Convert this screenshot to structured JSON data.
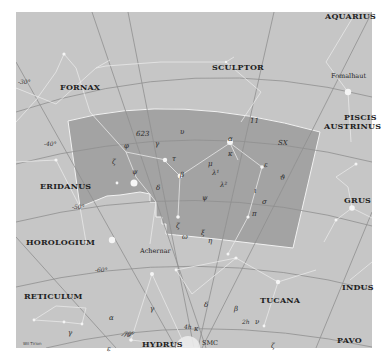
{
  "map": {
    "highlighted_constellation": "Phoenix",
    "colors": {
      "background": "#c6c6c6",
      "highlight": "#a3a3a3",
      "grid": "#8f8f8f",
      "lines": "#e8e8e8",
      "boundary": "#f2f2f2"
    },
    "constellations": [
      {
        "name": "AQUARIUS",
        "x": 325,
        "y": 12
      },
      {
        "name": "FORNAX",
        "x": 60,
        "y": 83
      },
      {
        "name": "SCULPTOR",
        "x": 212,
        "y": 63
      },
      {
        "name": "PISCIS",
        "x": 344,
        "y": 113
      },
      {
        "name": "AUSTRINUS",
        "x": 324,
        "y": 122
      },
      {
        "name": "ERIDANUS",
        "x": 40,
        "y": 182
      },
      {
        "name": "GRUS",
        "x": 344,
        "y": 196
      },
      {
        "name": "HOROLOGIUM",
        "x": 26,
        "y": 238
      },
      {
        "name": "INDUS",
        "x": 342,
        "y": 283
      },
      {
        "name": "RETICULUM",
        "x": 24,
        "y": 292
      },
      {
        "name": "TUCANA",
        "x": 260,
        "y": 296
      },
      {
        "name": "PAVO",
        "x": 337,
        "y": 336
      },
      {
        "name": "HYDRUS",
        "x": 142,
        "y": 340
      }
    ],
    "star_names": [
      {
        "name": "Fomalhaut",
        "x": 331,
        "y": 72
      },
      {
        "name": "Achernar",
        "x": 140,
        "y": 247
      }
    ],
    "greek_letters": [
      {
        "t": "623",
        "x": 136,
        "y": 130
      },
      {
        "t": "υ",
        "x": 180,
        "y": 128
      },
      {
        "t": "φ",
        "x": 124,
        "y": 142
      },
      {
        "t": "γ",
        "x": 155,
        "y": 140
      },
      {
        "t": "α",
        "x": 228,
        "y": 135
      },
      {
        "t": "SX",
        "x": 278,
        "y": 139
      },
      {
        "t": "11",
        "x": 250,
        "y": 117
      },
      {
        "t": "κ",
        "x": 228,
        "y": 150
      },
      {
        "t": "ε",
        "x": 264,
        "y": 161
      },
      {
        "t": "ζ",
        "x": 112,
        "y": 158
      },
      {
        "t": "τ",
        "x": 172,
        "y": 155
      },
      {
        "t": "μ",
        "x": 208,
        "y": 160
      },
      {
        "t": "λ¹",
        "x": 212,
        "y": 169
      },
      {
        "t": "ψ",
        "x": 132,
        "y": 168
      },
      {
        "t": "β",
        "x": 180,
        "y": 171
      },
      {
        "t": "ϑ",
        "x": 280,
        "y": 174
      },
      {
        "t": "λ²",
        "x": 220,
        "y": 181
      },
      {
        "t": "δ",
        "x": 156,
        "y": 184
      },
      {
        "t": "ι",
        "x": 254,
        "y": 187
      },
      {
        "t": "ψ",
        "x": 202,
        "y": 194
      },
      {
        "t": "σ",
        "x": 262,
        "y": 198
      },
      {
        "t": "π",
        "x": 252,
        "y": 210
      },
      {
        "t": "ζ",
        "x": 176,
        "y": 222
      },
      {
        "t": "ω",
        "x": 182,
        "y": 233
      },
      {
        "t": "ξ",
        "x": 201,
        "y": 229
      },
      {
        "t": "η",
        "x": 208,
        "y": 237
      },
      {
        "t": "γ",
        "x": 150,
        "y": 305
      },
      {
        "t": "γ",
        "x": 68,
        "y": 329
      },
      {
        "t": "α",
        "x": 109,
        "y": 314
      },
      {
        "t": "δ",
        "x": 204,
        "y": 301
      },
      {
        "t": "β",
        "x": 234,
        "y": 305
      },
      {
        "t": "κ",
        "x": 194,
        "y": 325
      },
      {
        "t": "ε",
        "x": 107,
        "y": 345
      },
      {
        "t": "ν",
        "x": 255,
        "y": 318
      },
      {
        "t": "ζ",
        "x": 271,
        "y": 342
      }
    ],
    "coord_labels": [
      {
        "t": "-30°",
        "x": 18,
        "y": 78
      },
      {
        "t": "-40°",
        "x": 44,
        "y": 140
      },
      {
        "t": "-50°",
        "x": 72,
        "y": 203
      },
      {
        "t": "-60°",
        "x": 95,
        "y": 266
      },
      {
        "t": "-70°",
        "x": 121,
        "y": 331
      },
      {
        "t": "4h",
        "x": 184,
        "y": 323
      },
      {
        "t": "2h",
        "x": 242,
        "y": 318
      },
      {
        "t": "-70°",
        "x": 122,
        "y": 330
      }
    ],
    "other_labels": [
      {
        "t": "SMC",
        "x": 202,
        "y": 339
      }
    ],
    "credit": "Wil Tirion"
  }
}
